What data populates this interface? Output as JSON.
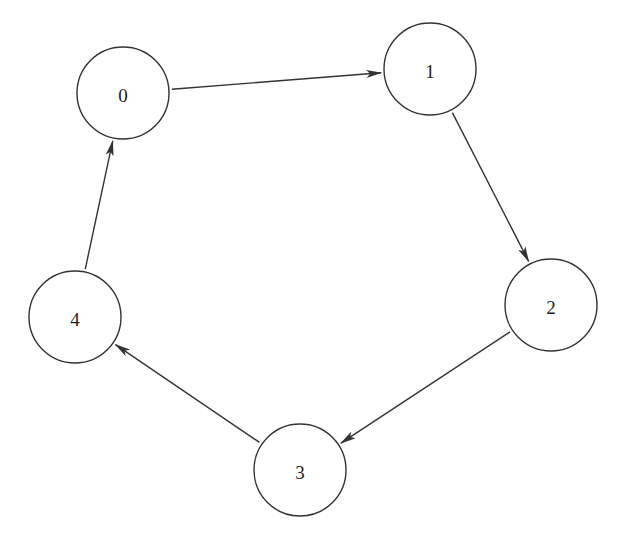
{
  "diagram": {
    "type": "directed-cycle-graph",
    "nodes": [
      {
        "id": "0",
        "label": "0",
        "cx": 123,
        "cy": 93,
        "r": 46
      },
      {
        "id": "1",
        "label": "1",
        "cx": 430,
        "cy": 69,
        "r": 46
      },
      {
        "id": "2",
        "label": "2",
        "cx": 551,
        "cy": 305,
        "r": 46
      },
      {
        "id": "3",
        "label": "3",
        "cx": 300,
        "cy": 470,
        "r": 46
      },
      {
        "id": "4",
        "label": "4",
        "cx": 75,
        "cy": 317,
        "r": 46
      }
    ],
    "edges": [
      {
        "from": "0",
        "to": "1"
      },
      {
        "from": "1",
        "to": "2"
      },
      {
        "from": "2",
        "to": "3"
      },
      {
        "from": "3",
        "to": "4"
      },
      {
        "from": "4",
        "to": "0"
      }
    ],
    "colors": {
      "stroke": "#333333",
      "fill": "#ffffff",
      "text": "#222222"
    }
  }
}
